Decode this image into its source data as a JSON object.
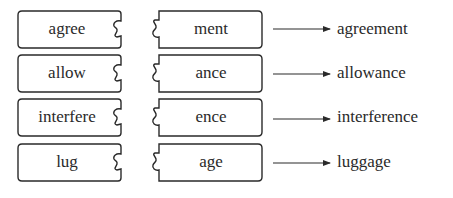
{
  "diagram": {
    "type": "word-building puzzle",
    "stroke_color": "#2a2a2a",
    "text_color": "#2a2a2a",
    "rows": [
      {
        "stem": "agree",
        "suffix": "ment",
        "result": "agreement"
      },
      {
        "stem": "allow",
        "suffix": "ance",
        "result": "allowance"
      },
      {
        "stem": "interfere",
        "suffix": "ence",
        "result": "interference"
      },
      {
        "stem": "lug",
        "suffix": "age",
        "result": "luggage"
      }
    ]
  }
}
